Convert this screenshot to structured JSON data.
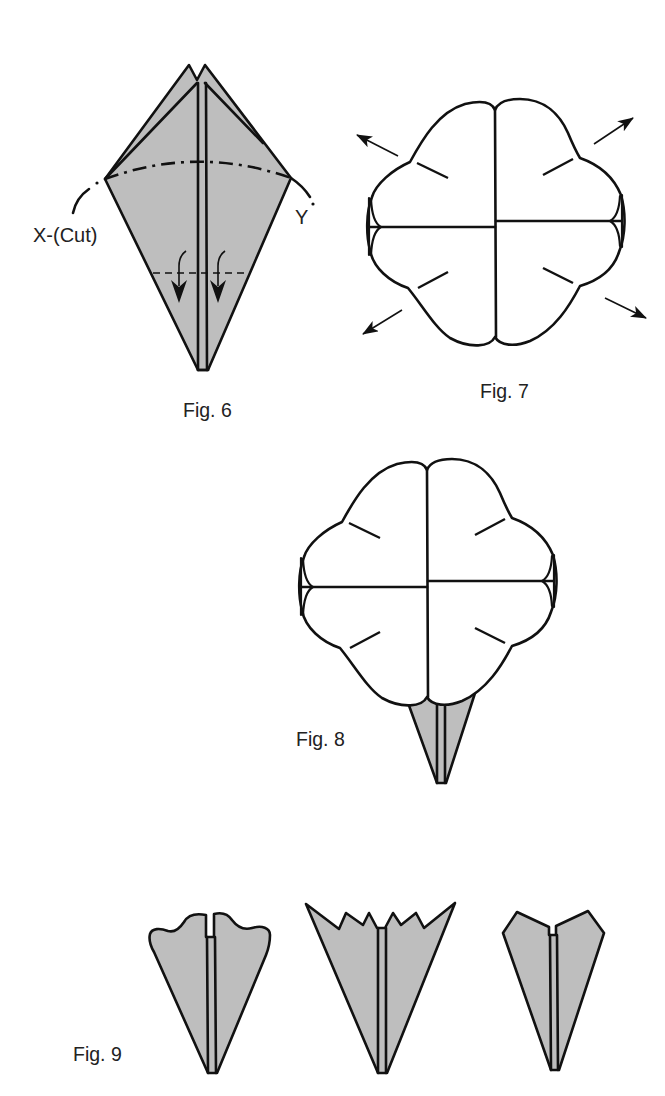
{
  "colors": {
    "paper_fill": "#bebebe",
    "flower_fill": "#ffffff",
    "line": "#111111",
    "background": "#ffffff"
  },
  "figures": [
    {
      "label": "Fig. 6",
      "annotations": {
        "cut_line_start": "X-(Cut)",
        "cut_line_end": "Y"
      },
      "description": "Folded kite shape with dash-dot cut line X to Y and valley-fold arrows at bottom"
    },
    {
      "label": "Fig. 7",
      "description": "Unfolded four-petal flower with four outward arrows"
    },
    {
      "label": "Fig. 8",
      "description": "Flower with folded stem base below"
    },
    {
      "label": "Fig. 9",
      "description": "Three cut variations: wavy, zigzag, pointed",
      "variants": [
        "wavy-top",
        "zigzag-top",
        "pointed-top"
      ]
    }
  ]
}
